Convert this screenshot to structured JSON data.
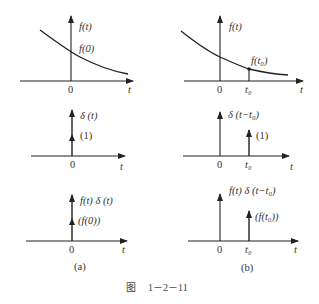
{
  "figure": {
    "caption_prefix": "图",
    "caption_number": "1－2－11",
    "panels": [
      {
        "id": "a",
        "label": "(a)",
        "plots": [
          {
            "name": "signal",
            "ylabel": "f(t)",
            "annotation": "f(0)",
            "origin": "0",
            "xlabel": "t"
          },
          {
            "name": "impulse",
            "ylabel": "δ (t)",
            "strength": "(1)",
            "origin": "0",
            "xlabel": "t"
          },
          {
            "name": "product",
            "ylabel": "f(t) δ (t)",
            "strength": "(f(0))",
            "origin": "0",
            "xlabel": "t"
          }
        ]
      },
      {
        "id": "b",
        "label": "(b)",
        "plots": [
          {
            "name": "signal",
            "ylabel": "f(t)",
            "annotation": "f(t₀)",
            "origin": "0",
            "tick": "t₀",
            "xlabel": "t"
          },
          {
            "name": "shifted-impulse",
            "ylabel": "δ (t−t₀)",
            "strength": "(1)",
            "origin": "0",
            "tick": "t₀",
            "xlabel": "t"
          },
          {
            "name": "product",
            "ylabel": "f(t) δ (t−t₀)",
            "strength": "(f(t₀))",
            "origin": "0",
            "tick": "t₀",
            "xlabel": "t"
          }
        ]
      }
    ]
  }
}
